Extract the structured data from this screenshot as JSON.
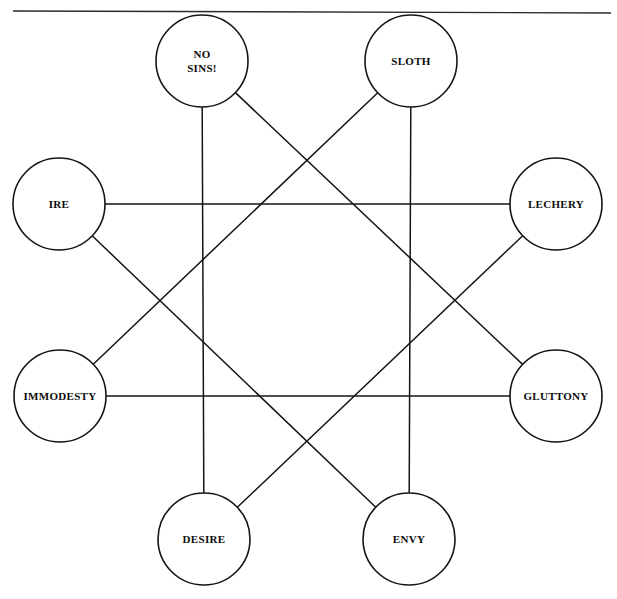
{
  "diagram": {
    "type": "node-link-star",
    "canvas": {
      "width": 617,
      "height": 599
    },
    "style": {
      "background": "#ffffff",
      "line_color": "#151515",
      "text_color": "#0c0c0c",
      "node_fill": "#ffffff"
    },
    "top_rule": {
      "x1": 13,
      "y1": 11,
      "x2": 611,
      "y2": 13
    },
    "node_radius": 46,
    "nodes": [
      {
        "id": "no-sins",
        "label": "NO SINS!",
        "lines": [
          "NO",
          "SINS!"
        ],
        "cx": 202,
        "cy": 61,
        "position": "top-left"
      },
      {
        "id": "sloth",
        "label": "SLOTH",
        "lines": [
          "SLOTH"
        ],
        "cx": 411,
        "cy": 61,
        "position": "top-right"
      },
      {
        "id": "ire",
        "label": "IRE",
        "lines": [
          "IRE"
        ],
        "cx": 59,
        "cy": 204,
        "position": "upper-left"
      },
      {
        "id": "lechery",
        "label": "LECHERY",
        "lines": [
          "LECHERY"
        ],
        "cx": 556,
        "cy": 204,
        "position": "upper-right"
      },
      {
        "id": "immodesty",
        "label": "IMMODESTY",
        "lines": [
          "IMMODESTY"
        ],
        "cx": 60,
        "cy": 396,
        "position": "lower-left"
      },
      {
        "id": "gluttony",
        "label": "GLUTTONY",
        "lines": [
          "GLUTTONY"
        ],
        "cx": 556,
        "cy": 396,
        "position": "lower-right"
      },
      {
        "id": "desire",
        "label": "DESIRE",
        "lines": [
          "DESIRE"
        ],
        "cx": 204,
        "cy": 539,
        "position": "bottom-left"
      },
      {
        "id": "envy",
        "label": "ENVY",
        "lines": [
          "ENVY"
        ],
        "cx": 409,
        "cy": 539,
        "position": "bottom-right"
      }
    ],
    "edges": [
      {
        "id": "edge-no-sins-desire",
        "from": "no-sins",
        "to": "desire"
      },
      {
        "id": "edge-no-sins-gluttony",
        "from": "no-sins",
        "to": "gluttony"
      },
      {
        "id": "edge-sloth-envy",
        "from": "sloth",
        "to": "envy"
      },
      {
        "id": "edge-sloth-immodesty",
        "from": "sloth",
        "to": "immodesty"
      },
      {
        "id": "edge-ire-lechery",
        "from": "ire",
        "to": "lechery"
      },
      {
        "id": "edge-ire-envy",
        "from": "ire",
        "to": "envy"
      },
      {
        "id": "edge-lechery-desire",
        "from": "lechery",
        "to": "desire"
      },
      {
        "id": "edge-immodesty-gluttony",
        "from": "immodesty",
        "to": "gluttony"
      }
    ]
  }
}
